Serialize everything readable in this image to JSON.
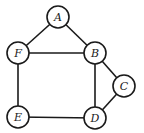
{
  "diagram": {
    "type": "undirected-graph",
    "node_radius": 11,
    "stroke_color": "#1a1a1a",
    "background": "#ffffff",
    "nodes": [
      {
        "id": "A",
        "label": "A",
        "x": 58,
        "y": 17
      },
      {
        "id": "F",
        "label": "F",
        "x": 18,
        "y": 53
      },
      {
        "id": "B",
        "label": "B",
        "x": 95,
        "y": 53
      },
      {
        "id": "C",
        "label": "C",
        "x": 124,
        "y": 86
      },
      {
        "id": "E",
        "label": "E",
        "x": 18,
        "y": 117
      },
      {
        "id": "D",
        "label": "D",
        "x": 95,
        "y": 118
      }
    ],
    "edges": [
      {
        "from": "A",
        "to": "F"
      },
      {
        "from": "A",
        "to": "B"
      },
      {
        "from": "F",
        "to": "B"
      },
      {
        "from": "F",
        "to": "E"
      },
      {
        "from": "B",
        "to": "D"
      },
      {
        "from": "B",
        "to": "C"
      },
      {
        "from": "C",
        "to": "D"
      },
      {
        "from": "E",
        "to": "D"
      }
    ]
  }
}
